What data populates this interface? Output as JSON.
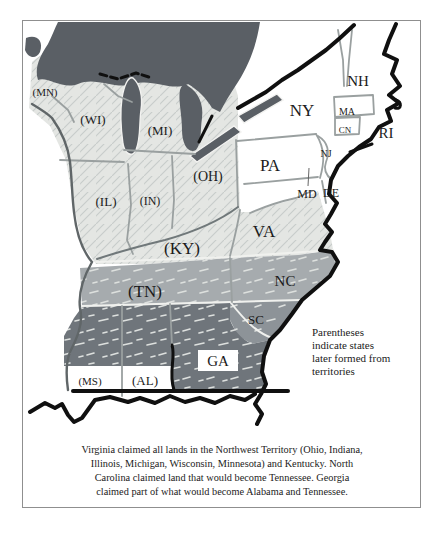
{
  "map": {
    "colors": {
      "frame": "#8f8f8f",
      "canada": "#5a5f65",
      "lake": "#5a5f65",
      "light": "#e4e6e3",
      "light_hatch": "#c7ccca",
      "mid": "#a6abae",
      "mid2": "#8d9398",
      "dark": "#6f757b",
      "speckle": "#dde0de",
      "coast": "#101010",
      "border": "#9aa0a0",
      "river": "#606668",
      "label": "#1b1b1b"
    },
    "labels": [
      {
        "id": "mn",
        "text": "(MN)"
      },
      {
        "id": "wi",
        "text": "(WI)"
      },
      {
        "id": "mi",
        "text": "(MI)"
      },
      {
        "id": "oh",
        "text": "(OH)"
      },
      {
        "id": "il",
        "text": "(IL)"
      },
      {
        "id": "in",
        "text": "(IN)"
      },
      {
        "id": "ky",
        "text": "(KY)"
      },
      {
        "id": "tn",
        "text": "(TN)"
      },
      {
        "id": "ms",
        "text": "(MS)"
      },
      {
        "id": "al",
        "text": "(AL)"
      },
      {
        "id": "ga",
        "text": "GA"
      },
      {
        "id": "sc",
        "text": "SC"
      },
      {
        "id": "nc",
        "text": "NC"
      },
      {
        "id": "va",
        "text": "VA"
      },
      {
        "id": "pa",
        "text": "PA"
      },
      {
        "id": "ny",
        "text": "NY"
      },
      {
        "id": "nh",
        "text": "NH"
      },
      {
        "id": "ma",
        "text": "MA"
      },
      {
        "id": "cn",
        "text": "CN"
      },
      {
        "id": "ri",
        "text": "RI"
      },
      {
        "id": "nj",
        "text": "NJ"
      },
      {
        "id": "md",
        "text": "MD"
      },
      {
        "id": "de",
        "text": "DE"
      }
    ],
    "annotation": {
      "lines": [
        "Parentheses",
        "indicate states",
        "later formed from",
        "territories"
      ]
    },
    "caption": {
      "lines": [
        "Virginia claimed all lands in the Northwest Territory (Ohio, Indiana,",
        "Illinois, Michigan, Wisconsin, Minnesota) and Kentucky. North",
        "Carolina claimed land that would become Tennessee. Georgia",
        "claimed part of what would become Alabama and Tennessee."
      ]
    }
  }
}
